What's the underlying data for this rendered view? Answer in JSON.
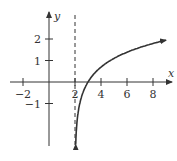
{
  "chart_data": {
    "type": "line",
    "title": "",
    "xlabel": "x",
    "ylabel": "y",
    "xlim": [
      -2.6,
      9.5
    ],
    "ylim": [
      -3.1,
      2.9
    ],
    "x_ticks": [
      -2,
      2,
      4,
      6,
      8
    ],
    "x_tick_labels": [
      "−2",
      "2",
      "4",
      "6",
      "8"
    ],
    "y_ticks": [
      -1,
      1,
      2
    ],
    "y_tick_labels": [
      "−1",
      "1",
      "2"
    ],
    "grid": false,
    "legend": null,
    "asymptote": {
      "type": "vertical",
      "x": 2,
      "style": "dashed"
    },
    "series": [
      {
        "name": "y = ln(x − 2)",
        "x": [
          2.05,
          2.1,
          2.2,
          2.4,
          2.6,
          3,
          3.5,
          4,
          5,
          6,
          7,
          8,
          9
        ],
        "y": [
          -3.0,
          -2.3,
          -1.61,
          -0.92,
          -0.51,
          0,
          0.41,
          0.69,
          1.1,
          1.39,
          1.61,
          1.79,
          1.95
        ]
      }
    ],
    "colors": {
      "axis": "#333333",
      "curve": "#333333",
      "asymptote": "#333333"
    }
  }
}
